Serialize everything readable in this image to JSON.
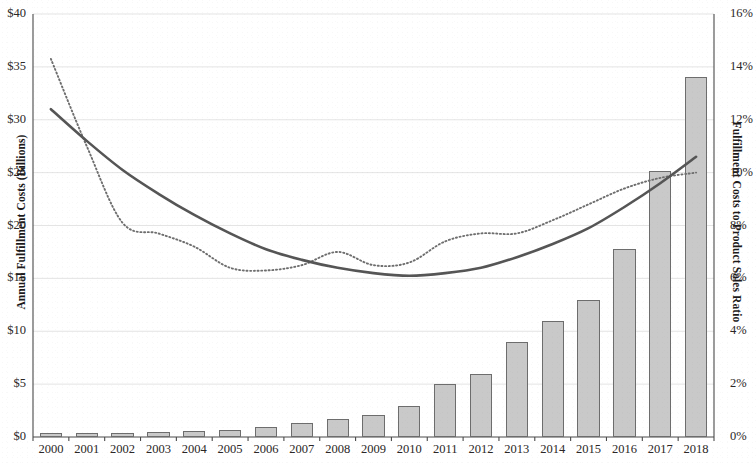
{
  "chart_data": {
    "type": "bar",
    "title": "",
    "subtitle": "",
    "xlabel": "",
    "ylabel": "Annual Fulfillment Costs (Billions)",
    "y2label": "Fulfillment Costs to Product Sales Ratio",
    "grid": true,
    "legend": "none",
    "categories": [
      "2000",
      "2001",
      "2002",
      "2003",
      "2004",
      "2005",
      "2006",
      "2007",
      "2008",
      "2009",
      "2010",
      "2011",
      "2012",
      "2013",
      "2014",
      "2015",
      "2016",
      "2017",
      "2018"
    ],
    "ylim": [
      0,
      40
    ],
    "y2lim": [
      0,
      16
    ],
    "y_ticks": [
      "$0",
      "$5",
      "$10",
      "$15",
      "$20",
      "$25",
      "$30",
      "$35",
      "$40"
    ],
    "y_tick_values": [
      0,
      5,
      10,
      15,
      20,
      25,
      30,
      35,
      40
    ],
    "y2_ticks": [
      "0%",
      "2%",
      "4%",
      "6%",
      "8%",
      "10%",
      "12%",
      "14%",
      "16%"
    ],
    "y2_tick_values": [
      0,
      2,
      4,
      6,
      8,
      10,
      12,
      14,
      16
    ],
    "series": [
      {
        "name": "Annual Fulfillment Costs (Billions)",
        "type": "bar",
        "axis": "left",
        "units": "$B",
        "color": "#c9c9c9",
        "edge_color": "#6d6d6d",
        "values": [
          0.4,
          0.4,
          0.4,
          0.5,
          0.6,
          0.7,
          0.9,
          1.3,
          1.7,
          2.1,
          2.9,
          5.0,
          6.0,
          9.0,
          11.0,
          13.0,
          17.8,
          25.2,
          34.0
        ]
      },
      {
        "name": "Fulfillment Costs to Product Sales Ratio",
        "type": "line",
        "style": "dotted",
        "axis": "right",
        "units": "%",
        "color": "#6e6e6e",
        "values": [
          14.3,
          11.0,
          8.1,
          7.7,
          7.2,
          6.4,
          6.3,
          6.5,
          7.0,
          6.5,
          6.6,
          7.4,
          7.7,
          7.7,
          8.2,
          8.8,
          9.4,
          9.8,
          10.0
        ]
      },
      {
        "name": "Polynomial trend",
        "type": "line",
        "style": "solid",
        "axis": "right",
        "units": "%",
        "color": "#555555",
        "values": [
          12.4,
          11.2,
          10.1,
          9.2,
          8.4,
          7.7,
          7.1,
          6.7,
          6.4,
          6.2,
          6.1,
          6.2,
          6.4,
          6.8,
          7.3,
          7.9,
          8.7,
          9.6,
          10.6
        ]
      }
    ]
  }
}
